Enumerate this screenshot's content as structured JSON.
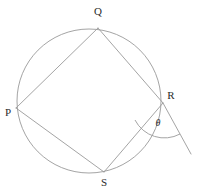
{
  "figure": {
    "background_color": "#ffffff",
    "stroke_color": "#9a9a9a",
    "label_color": "#2b2b2b",
    "stroke_width": 0.9
  },
  "circle": {
    "name": "circumcircle",
    "cx": 89,
    "cy": 101,
    "r": 72
  },
  "vertices": [
    {
      "id": "Q",
      "label": "Q",
      "x": 98,
      "y": 28,
      "label_x": 98,
      "label_y": 15
    },
    {
      "id": "P",
      "label": "P",
      "x": 16,
      "y": 108,
      "label_x": 8,
      "label_y": 116
    },
    {
      "id": "R",
      "label": "R",
      "x": 163,
      "y": 103,
      "label_x": 171,
      "label_y": 99
    },
    {
      "id": "S",
      "label": "S",
      "x": 104,
      "y": 172,
      "label_x": 104,
      "label_y": 186
    }
  ],
  "chords": [
    {
      "id": "PQ",
      "name": "chord-pq",
      "x1": 16,
      "y1": 108,
      "x2": 98,
      "y2": 28
    },
    {
      "id": "QR",
      "name": "chord-qr",
      "x1": 98,
      "y1": 28,
      "x2": 163,
      "y2": 103
    },
    {
      "id": "RS",
      "name": "chord-rs",
      "x1": 163,
      "y1": 103,
      "x2": 104,
      "y2": 172
    },
    {
      "id": "SP",
      "name": "chord-sp",
      "x1": 104,
      "y1": 172,
      "x2": 16,
      "y2": 108
    }
  ],
  "exterior_line": {
    "id": "RT",
    "name": "exterior-ray-from-r",
    "x1": 163,
    "y1": 103,
    "x2": 191,
    "y2": 154
  },
  "angle_arc": {
    "id": "theta",
    "label": "θ",
    "vertex_x": 163,
    "vertex_y": 103,
    "radius": 33,
    "start_x": 135,
    "start_y": 120,
    "end_x": 180,
    "end_y": 134,
    "label_x": 158,
    "label_y": 126
  }
}
